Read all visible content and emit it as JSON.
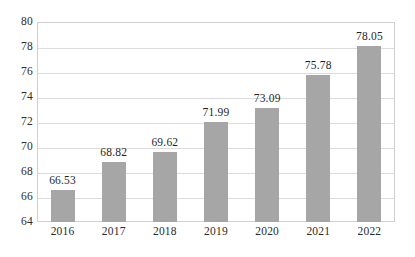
{
  "chart_data": {
    "type": "bar",
    "title": "",
    "subtitle": "",
    "xlabel": "",
    "ylabel": "",
    "categories": [
      "2016",
      "2017",
      "2018",
      "2019",
      "2020",
      "2021",
      "2022"
    ],
    "values": [
      66.53,
      68.82,
      69.62,
      71.99,
      73.09,
      75.78,
      78.05
    ],
    "value_labels": [
      "66.53",
      "68.82",
      "69.62",
      "71.99",
      "73.09",
      "75.78",
      "78.05"
    ],
    "series": [
      {
        "name": "",
        "values": [
          66.53,
          68.82,
          69.62,
          71.99,
          73.09,
          75.78,
          78.05
        ]
      }
    ],
    "ylim": [
      64,
      80
    ],
    "ytick_values": [
      64,
      66,
      68,
      70,
      72,
      74,
      76,
      78,
      80
    ],
    "ytick_labels": [
      "64",
      "66",
      "68",
      "70",
      "72",
      "74",
      "76",
      "78",
      "80"
    ],
    "ytick_step": 2,
    "grid": true,
    "grid_axis": "y",
    "legend": false,
    "legend_position": "none",
    "annotations": [],
    "bar_color": "#a6a6a6",
    "gridline_color": "#dcdcdc",
    "plot_border_color": "#d0d0d0",
    "tick_label_color": "#2b2b2b",
    "value_label_color": "#1f1f1f"
  },
  "caption": {
    "text": "",
    "clipped": true
  }
}
